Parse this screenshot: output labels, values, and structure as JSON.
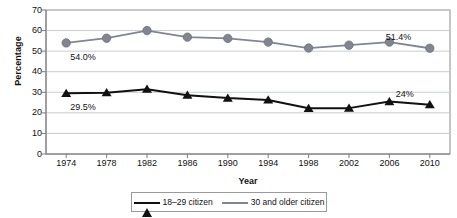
{
  "chart_data": {
    "type": "line",
    "title": "",
    "xlabel": "Year",
    "ylabel": "Percentage",
    "categories": [
      "1974",
      "1978",
      "1982",
      "1986",
      "1990",
      "1994",
      "1998",
      "2002",
      "2006",
      "2010"
    ],
    "ylim": [
      0,
      70
    ],
    "ytick_step": 10,
    "yticks": [
      "70",
      "60",
      "50",
      "40",
      "30",
      "20",
      "10",
      "0"
    ],
    "grid": "horizontal",
    "legend_position": "bottom",
    "series": [
      {
        "name": "18–29 citizen",
        "marker": "triangle",
        "color": "#111111",
        "values": [
          29.5,
          29.8,
          31.5,
          28.6,
          27.2,
          26.3,
          22.2,
          22.3,
          25.5,
          24.0
        ]
      },
      {
        "name": "30 and older citizen",
        "marker": "circle",
        "color": "#81858f",
        "values": [
          54.0,
          56.3,
          60.0,
          56.8,
          56.2,
          54.4,
          51.5,
          52.9,
          54.4,
          51.4
        ]
      }
    ],
    "annotations": [
      {
        "text": "54.0%",
        "series": "30 and older citizen",
        "at": "1974",
        "position": "below-left"
      },
      {
        "text": "29.5%",
        "series": "18–29 citizen",
        "at": "1974",
        "position": "below-left"
      },
      {
        "text": "51.4%",
        "series": "30 and older citizen",
        "at": "2010",
        "position": "above-left"
      },
      {
        "text": "24%",
        "series": "18–29 citizen",
        "at": "2010",
        "position": "above-left"
      }
    ]
  },
  "legend": {
    "items": [
      {
        "label": "18–29 citizen"
      },
      {
        "label": "30 and older citizen"
      }
    ]
  }
}
